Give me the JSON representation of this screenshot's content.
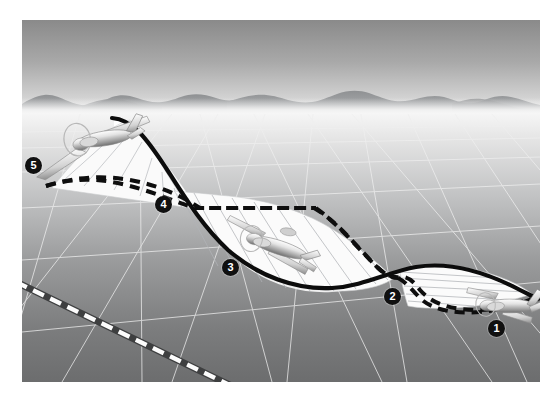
{
  "illustration": {
    "title": "Aircraft flight-path oscillation over dry lakebed",
    "frame": {
      "width": 560,
      "height": 402,
      "background": "#ffffff"
    },
    "scene": {
      "x": 22,
      "y": 20,
      "width": 518,
      "height": 362
    },
    "sky": {
      "top_color": "#8d8d8d",
      "bottom_color": "#dcdcdc",
      "horizon_y": 93
    },
    "mountains": {
      "color": "#9fa0a1",
      "haze_color": "#e6e6e6",
      "ridge_top_y": 74,
      "ridge_base_y": 94
    },
    "ground": {
      "near_color": "#6f7071",
      "far_color": "#f2f2f2",
      "grid_line_color": "#e9e9e9",
      "label": "dry lakebed"
    },
    "runway": {
      "name": "runway-centerline",
      "line_color": "#3a3a3a",
      "dash_color": "#ffffff",
      "dash_count": 12
    },
    "paths": {
      "solid": {
        "name": "flight-path",
        "style": "solid",
        "color": "#0d0d0d",
        "width": 4
      },
      "dashed": {
        "name": "ground-track",
        "style": "dashed",
        "color": "#0d0d0d",
        "width": 4,
        "dash": "9 7"
      },
      "ribbon": {
        "name": "path-ribbon-surface",
        "fill": "#fbfbfb",
        "hatch_color": "#b9bcc0"
      }
    },
    "aircraft": [
      {
        "name": "aircraft-stage-5",
        "at_marker": "5",
        "attitude": "nose-up climbing",
        "x": 72,
        "y": 126
      },
      {
        "name": "aircraft-stage-3",
        "at_marker": "3",
        "attitude": "level mid-descent",
        "x": 268,
        "y": 226
      },
      {
        "name": "aircraft-stage-1",
        "at_marker": "1",
        "attitude": "nose-down entry",
        "x": 503,
        "y": 301
      }
    ],
    "markers": [
      {
        "label": "1",
        "x": 488,
        "y": 320,
        "name": "marker-1"
      },
      {
        "label": "2",
        "x": 384,
        "y": 288,
        "name": "marker-2"
      },
      {
        "label": "3",
        "x": 222,
        "y": 259,
        "name": "marker-3"
      },
      {
        "label": "4",
        "x": 155,
        "y": 196,
        "name": "marker-4"
      },
      {
        "label": "5",
        "x": 25,
        "y": 157,
        "name": "marker-5"
      }
    ]
  }
}
